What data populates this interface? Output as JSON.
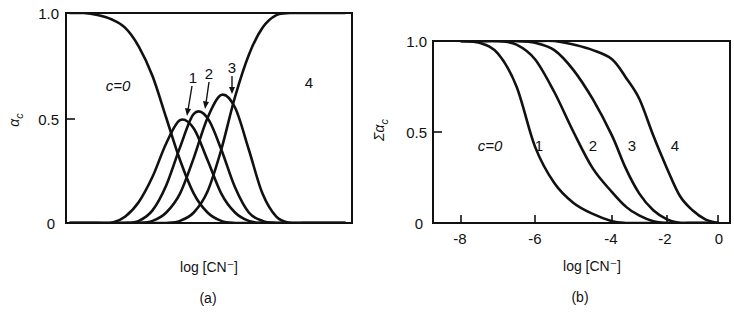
{
  "figure": {
    "panels": [
      {
        "id": "a",
        "caption": "(a)",
        "xlabel": "log [CN⁻]",
        "ylabel": "αc",
        "yticks": [
          "0",
          "0.5",
          "1.0"
        ],
        "xticks": [],
        "curve_labels": [
          "c=0",
          "1",
          "2",
          "3",
          "4"
        ]
      },
      {
        "id": "b",
        "caption": "(b)",
        "xlabel": "log [CN⁻]",
        "ylabel": "Σαc",
        "yticks": [
          "0",
          "0.5",
          "1.0"
        ],
        "xticks": [
          "-8",
          "-6",
          "-4",
          "-2",
          "0"
        ],
        "curve_labels": [
          "c=0",
          "1",
          "2",
          "3",
          "4"
        ]
      }
    ]
  },
  "chart_data": [
    {
      "type": "line",
      "title": "(a) Fraction of species vs log[CN-]",
      "xlabel": "log [CN⁻]",
      "ylabel": "αc",
      "ylim": [
        0,
        1.0
      ],
      "yticks": [
        0,
        0.5,
        1.0
      ],
      "xticks": [],
      "grid": false,
      "legend": "inline labels",
      "x_units": "arbitrary (no tick labels)",
      "x": [
        0,
        0.05,
        0.1,
        0.15,
        0.2,
        0.25,
        0.3,
        0.35,
        0.4,
        0.45,
        0.5,
        0.55,
        0.6,
        0.65,
        0.7,
        0.75,
        0.8,
        0.85,
        0.9,
        0.95,
        1.0
      ],
      "series": [
        {
          "name": "c=0",
          "values": [
            1.0,
            1.0,
            0.99,
            0.97,
            0.93,
            0.84,
            0.7,
            0.5,
            0.3,
            0.14,
            0.05,
            0.01,
            0,
            0,
            0,
            0,
            0,
            0,
            0,
            0,
            0
          ]
        },
        {
          "name": "1",
          "values": [
            0,
            0,
            0,
            0,
            0.03,
            0.1,
            0.22,
            0.38,
            0.49,
            0.45,
            0.3,
            0.14,
            0.05,
            0.01,
            0,
            0,
            0,
            0,
            0,
            0,
            0
          ]
        },
        {
          "name": "2",
          "values": [
            0,
            0,
            0,
            0,
            0,
            0.01,
            0.06,
            0.18,
            0.36,
            0.52,
            0.5,
            0.35,
            0.17,
            0.05,
            0.01,
            0,
            0,
            0,
            0,
            0,
            0
          ]
        },
        {
          "name": "3",
          "values": [
            0,
            0,
            0,
            0,
            0,
            0,
            0.01,
            0.05,
            0.14,
            0.31,
            0.5,
            0.61,
            0.55,
            0.35,
            0.14,
            0.03,
            0,
            0,
            0,
            0,
            0
          ]
        },
        {
          "name": "4",
          "values": [
            0,
            0,
            0,
            0,
            0,
            0,
            0,
            0,
            0.01,
            0.05,
            0.15,
            0.35,
            0.6,
            0.8,
            0.93,
            0.99,
            1.0,
            1.0,
            1.0,
            1.0,
            1.0
          ]
        }
      ],
      "annotations": [
        {
          "text": "c=0",
          "near": "left plateau"
        },
        {
          "text": "1",
          "arrow_to_peak": 0.5
        },
        {
          "text": "2",
          "arrow_to_peak": 0.53
        },
        {
          "text": "3",
          "arrow_to_peak": 0.61
        },
        {
          "text": "4",
          "near": "right plateau"
        }
      ]
    },
    {
      "type": "line",
      "title": "(b) Cumulative fraction Σαc vs log[CN-]",
      "xlabel": "log [CN⁻]",
      "ylabel": "Σαc",
      "ylim": [
        0,
        1.0
      ],
      "xlim": [
        -9.0,
        0.3
      ],
      "yticks": [
        0,
        0.5,
        1.0
      ],
      "xticks": [
        -8,
        -6,
        -4,
        -2,
        0
      ],
      "grid": false,
      "legend": "inline labels",
      "x": [
        -8,
        -7.5,
        -7,
        -6.5,
        -6,
        -5.5,
        -5,
        -4.5,
        -4,
        -3.5,
        -3,
        -2.5,
        -2,
        -1.5,
        -1,
        -0.5,
        0
      ],
      "series": [
        {
          "name": "1",
          "values": [
            1.0,
            0.99,
            0.93,
            0.75,
            0.42,
            0.22,
            0.11,
            0.05,
            0.01,
            0,
            0,
            0,
            0,
            0,
            0,
            0,
            0
          ]
        },
        {
          "name": "2",
          "values": [
            1.0,
            1.0,
            1.0,
            0.98,
            0.9,
            0.72,
            0.5,
            0.3,
            0.17,
            0.09,
            0.04,
            0.01,
            0,
            0,
            0,
            0,
            0
          ]
        },
        {
          "name": "3",
          "values": [
            1.0,
            1.0,
            1.0,
            1.0,
            0.99,
            0.95,
            0.84,
            0.68,
            0.48,
            0.3,
            0.16,
            0.07,
            0.02,
            0,
            0,
            0,
            0
          ]
        },
        {
          "name": "4",
          "values": [
            1.0,
            1.0,
            1.0,
            1.0,
            1.0,
            1.0,
            0.98,
            0.95,
            0.9,
            0.8,
            0.68,
            0.48,
            0.3,
            0.15,
            0.07,
            0.02,
            0
          ]
        }
      ],
      "annotations": [
        {
          "text": "c=0",
          "near": "left of curve 1"
        },
        {
          "text": "1"
        },
        {
          "text": "2"
        },
        {
          "text": "3"
        },
        {
          "text": "4"
        }
      ]
    }
  ]
}
